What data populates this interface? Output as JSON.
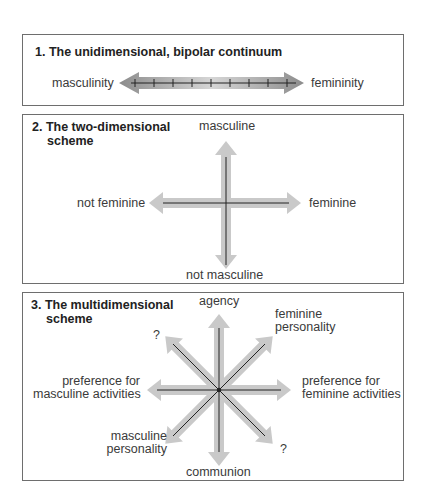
{
  "panel1": {
    "title": "1. The unidimensional, bipolar continuum",
    "left_label": "masculinity",
    "right_label": "femininity",
    "tick_count": 9
  },
  "panel2": {
    "title_line1": "2. The two-dimensional",
    "title_line2": "scheme",
    "top_label": "masculine",
    "bottom_label": "not masculine",
    "left_label": "not feminine",
    "right_label": "feminine"
  },
  "panel3": {
    "title_line1": "3. The multidimensional",
    "title_line2": "scheme",
    "top_label": "agency",
    "bottom_label": "communion",
    "top_right_label_1": "feminine",
    "top_right_label_2": "personality",
    "top_left_label": "?",
    "left_label_1": "preference for",
    "left_label_2": "masculine activities",
    "right_label_1": "preference for",
    "right_label_2": "feminine activities",
    "bottom_left_label_1": "masculine",
    "bottom_left_label_2": "personality",
    "bottom_right_label": "?"
  },
  "colors": {
    "arrow_fill": "#c9c9c9",
    "arrow_dark": "#8a8a8a",
    "axis_line": "#222222",
    "border": "#6e6e6e"
  }
}
